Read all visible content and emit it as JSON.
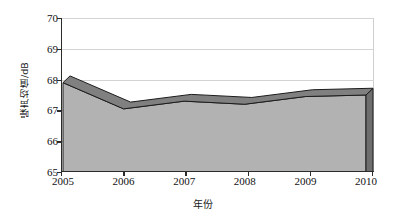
{
  "chart_data": {
    "type": "area",
    "title": "",
    "subtitle": "",
    "xlabel": "年份",
    "ylabel": "噪声均值/dB",
    "categories": [
      "2005",
      "2006",
      "2007",
      "2008",
      "2009",
      "2010"
    ],
    "values": [
      67.9,
      67.05,
      67.3,
      67.2,
      67.45,
      67.5
    ],
    "series": [
      {
        "name": "噪声均值",
        "values": [
          67.9,
          67.05,
          67.3,
          67.2,
          67.45,
          67.5
        ]
      }
    ],
    "ylim": [
      65,
      70
    ],
    "xlim_categories": [
      "2005",
      "2010"
    ],
    "ytick_labels": [
      "65",
      "66",
      "67",
      "68",
      "69",
      "70"
    ],
    "ytick_values": [
      65,
      66,
      67,
      68,
      69,
      70
    ],
    "xtick_labels": [
      "2005",
      "2006",
      "2007",
      "2008",
      "2009",
      "2010"
    ],
    "grid": "horizontal",
    "legend": "none",
    "style": "3d-area",
    "depth_offset_units": 0.22,
    "annotations": []
  },
  "colors": {
    "area_fill": "#b2b2b2",
    "area_top_ribbon": "#808080",
    "area_side_face": "#6e6e6e",
    "area_outline": "#1c1c1c",
    "gridline": "#d4d4d4",
    "axis": "#2b2b2b",
    "text": "#111111",
    "background": "#ffffff"
  },
  "axis_titles": {
    "y": "噪声均值/dB",
    "x": "年份"
  }
}
